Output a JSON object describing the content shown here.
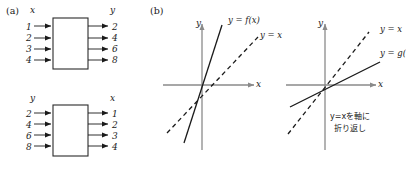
{
  "figure": {
    "panel_a": {
      "tag": "(a)",
      "box1": {
        "label": "f(x)",
        "input_header": "x",
        "output_header": "y",
        "inputs": [
          "1",
          "2",
          "3",
          "4"
        ],
        "outputs": [
          "2",
          "4",
          "6",
          "8"
        ]
      },
      "box2": {
        "label": "g(y)",
        "input_header": "y",
        "output_header": "x",
        "inputs": [
          "2",
          "4",
          "6",
          "8"
        ],
        "outputs": [
          "1",
          "2",
          "3",
          "4"
        ]
      }
    },
    "panel_b": {
      "tag": "(b)",
      "graph_left": {
        "x_axis_label": "x",
        "y_axis_label": "y",
        "solid_curve_label": "y = f(x)",
        "dashed_curve_label": "y = x"
      },
      "graph_right": {
        "x_axis_label": "x",
        "y_axis_label": "y",
        "dashed_curve_label": "y = x",
        "solid_curve_label": "y = g(",
        "annotation_line1": "y=xを軸に",
        "annotation_line2": "折り返し"
      }
    }
  },
  "colors": {
    "ink": "#1a1a1a",
    "axis": "#8a8a8a",
    "curve": "#1a1a1a",
    "box_stroke": "#2a2a2a",
    "paper": "#ffffff"
  }
}
